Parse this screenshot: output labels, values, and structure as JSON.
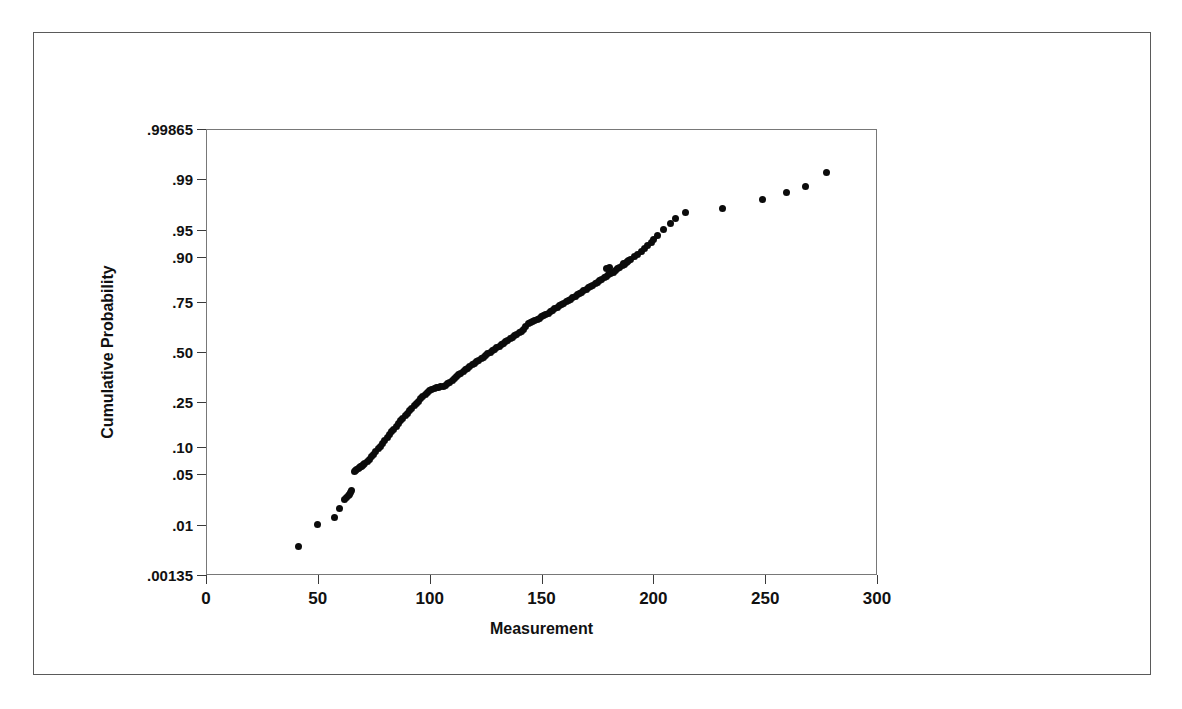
{
  "figure": {
    "background_color": "#ffffff",
    "border_color": "#5a5a5a",
    "axis_color": "#787878",
    "marker_color": "#0b0b0b"
  },
  "chart_data": {
    "type": "scatter",
    "plot_kind": "normal-probability-plot",
    "title": "",
    "subtitle": "",
    "xlabel": "Measurement",
    "ylabel": "Cumulative Probability",
    "grid": false,
    "legend": false,
    "legend_position": "none",
    "xlim": [
      0,
      300
    ],
    "xticks": [
      0,
      50,
      100,
      150,
      200,
      250,
      300
    ],
    "xticklabels": [
      "0",
      "50",
      "100",
      "150",
      "200",
      "250",
      "300"
    ],
    "yscale": "probit",
    "ylim": [
      0.00135,
      0.99865
    ],
    "yticks": [
      0.00135,
      0.01,
      0.05,
      0.1,
      0.25,
      0.5,
      0.75,
      0.9,
      0.95,
      0.99,
      0.99865
    ],
    "yticklabels": [
      ".00135",
      ".01",
      ".05",
      ".10",
      ".25",
      ".50",
      ".75",
      ".90",
      ".95",
      ".99",
      ".99865"
    ],
    "annotations": [],
    "series": [
      {
        "name": "Measurement",
        "marker": "filled-circle",
        "marker_size": 7,
        "color": "#0b0b0b",
        "n_points": 160,
        "x": [
          41.5,
          50.0,
          57.5,
          59.5,
          62.0,
          63.0,
          63.5,
          64.0,
          64.5,
          65.0,
          66.5,
          67.0,
          67.5,
          68.0,
          68.5,
          69.0,
          69.5,
          70.0,
          70.5,
          71.0,
          72.0,
          73.0,
          74.0,
          75.0,
          76.0,
          77.0,
          78.0,
          79.0,
          80.0,
          81.0,
          82.0,
          83.0,
          84.0,
          85.0,
          86.0,
          87.0,
          88.0,
          89.0,
          90.0,
          91.0,
          92.0,
          93.0,
          94.0,
          95.0,
          96.0,
          97.0,
          98.0,
          99.0,
          100.0,
          101.0,
          102.0,
          103.0,
          104.0,
          105.0,
          106.0,
          107.0,
          108.0,
          109.0,
          110.0,
          111.0,
          112.0,
          113.0,
          114.0,
          115.0,
          116.0,
          117.0,
          118.0,
          119.0,
          120.0,
          121.0,
          122.0,
          123.0,
          124.0,
          125.0,
          126.0,
          127.0,
          128.0,
          129.0,
          130.0,
          131.0,
          132.0,
          133.0,
          134.0,
          135.0,
          136.0,
          137.0,
          138.0,
          139.0,
          140.0,
          141.0,
          142.0,
          143.0,
          144.0,
          145.0,
          146.0,
          147.0,
          148.0,
          149.0,
          150.0,
          151.0,
          152.0,
          153.0,
          154.0,
          155.0,
          156.0,
          157.0,
          158.0,
          159.0,
          160.0,
          161.0,
          162.0,
          163.0,
          164.0,
          165.0,
          166.0,
          167.0,
          168.0,
          169.0,
          170.0,
          171.0,
          172.0,
          173.0,
          174.0,
          175.0,
          176.0,
          177.0,
          178.0,
          179.0,
          180.0,
          181.0,
          182.0,
          183.0,
          184.0,
          185.0,
          186.0,
          187.0,
          188.0,
          189.0,
          190.0,
          191.5,
          193.0,
          194.5,
          196.0,
          197.5,
          199.0,
          200.0,
          202.0,
          204.5,
          207.5,
          210.0,
          214.5,
          231.0,
          249.0,
          259.5,
          268.0,
          277.5,
          186.5,
          188.5,
          180.5,
          179.0
        ],
        "y": [
          0.0045,
          0.01,
          0.013,
          0.0175,
          0.0235,
          0.025,
          0.0265,
          0.028,
          0.0295,
          0.031,
          0.054,
          0.0555,
          0.057,
          0.058,
          0.0595,
          0.061,
          0.0625,
          0.064,
          0.0655,
          0.067,
          0.07,
          0.074,
          0.079,
          0.0845,
          0.09,
          0.096,
          0.103,
          0.11,
          0.118,
          0.126,
          0.134,
          0.142,
          0.15,
          0.159,
          0.168,
          0.177,
          0.186,
          0.196,
          0.205,
          0.215,
          0.225,
          0.234,
          0.244,
          0.254,
          0.264,
          0.274,
          0.284,
          0.294,
          0.303,
          0.309,
          0.313,
          0.316,
          0.318,
          0.32,
          0.322,
          0.328,
          0.335,
          0.343,
          0.352,
          0.361,
          0.37,
          0.379,
          0.388,
          0.396,
          0.405,
          0.414,
          0.422,
          0.431,
          0.439,
          0.448,
          0.456,
          0.465,
          0.473,
          0.481,
          0.49,
          0.498,
          0.506,
          0.514,
          0.522,
          0.53,
          0.538,
          0.546,
          0.554,
          0.562,
          0.57,
          0.578,
          0.586,
          0.594,
          0.602,
          0.61,
          0.618,
          0.633,
          0.648,
          0.655,
          0.66,
          0.665,
          0.67,
          0.676,
          0.682,
          0.688,
          0.694,
          0.7,
          0.706,
          0.713,
          0.719,
          0.725,
          0.732,
          0.738,
          0.744,
          0.75,
          0.756,
          0.762,
          0.768,
          0.774,
          0.78,
          0.785,
          0.79,
          0.795,
          0.8,
          0.806,
          0.811,
          0.816,
          0.821,
          0.826,
          0.831,
          0.836,
          0.841,
          0.845,
          0.85,
          0.855,
          0.859,
          0.864,
          0.868,
          0.873,
          0.877,
          0.881,
          0.886,
          0.89,
          0.894,
          0.9,
          0.906,
          0.912,
          0.918,
          0.924,
          0.93,
          0.935,
          0.942,
          0.95,
          0.958,
          0.964,
          0.97,
          0.973,
          0.98,
          0.984,
          0.987,
          0.992,
          0.882,
          0.888,
          0.872,
          0.869
        ]
      }
    ]
  }
}
